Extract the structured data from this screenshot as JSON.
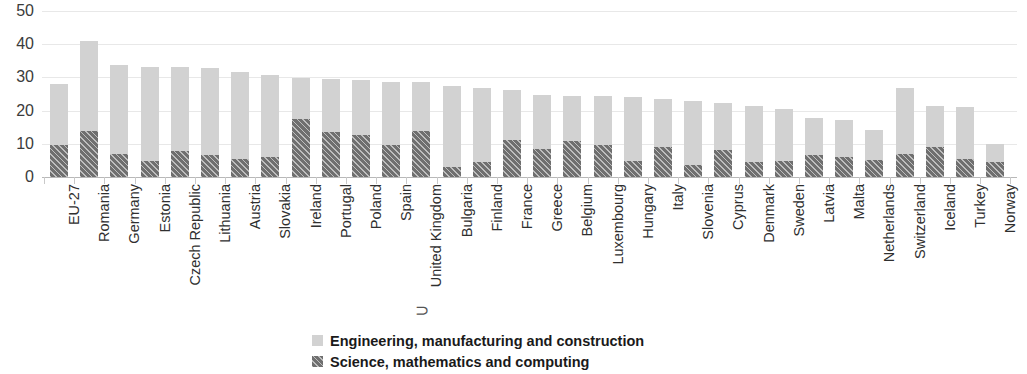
{
  "chart_data": {
    "type": "bar",
    "stacked": true,
    "title": "",
    "xlabel": "",
    "ylabel": "",
    "ylim": [
      0,
      50
    ],
    "yticks": [
      0,
      10,
      20,
      30,
      40,
      50
    ],
    "grid": true,
    "legend_position": "bottom",
    "categories": [
      "EU-27",
      "Romania",
      "Germany",
      "Estonia",
      "Czech Republic",
      "Lithuania",
      "Austria",
      "Slovakia",
      "Ireland",
      "Portugal",
      "Poland",
      "Spain",
      "United Kingdom",
      "Bulgaria",
      "Finland",
      "France",
      "Greece",
      "Belgium",
      "Luxembourg",
      "Hungary",
      "Italy",
      "Slovenia",
      "Cyprus",
      "Denmark",
      "Sweden",
      "Latvia",
      "Malta",
      "Netherlands",
      "Switzerland",
      "Iceland",
      "Turkey",
      "Norway"
    ],
    "series": [
      {
        "name": "Engineering, manufacturing and construction",
        "color": "#d2d2d2",
        "values": [
          18.3,
          27.0,
          26.8,
          28.4,
          25.3,
          26.2,
          26.2,
          24.8,
          12.3,
          15.9,
          16.5,
          19.1,
          14.6,
          24.4,
          22.3,
          15.2,
          16.4,
          13.8,
          14.9,
          19.5,
          14.6,
          19.3,
          14.3,
          16.9,
          15.7,
          11.4,
          11.2,
          9.2,
          19.8,
          12.5,
          15.7,
          5.3
        ]
      },
      {
        "name": "Science, mathematics and computing",
        "color": "#6f6f6f",
        "values": [
          9.7,
          14.0,
          6.9,
          4.8,
          7.7,
          6.7,
          5.5,
          5.9,
          17.5,
          13.5,
          12.6,
          9.6,
          13.9,
          3.1,
          4.6,
          11.0,
          8.3,
          10.7,
          9.6,
          4.7,
          9.0,
          3.6,
          8.0,
          4.5,
          4.9,
          6.5,
          6.0,
          5.1,
          7.0,
          9.0,
          5.3,
          4.5
        ]
      }
    ],
    "totals": [
      28.0,
      41.0,
      33.7,
      33.2,
      33.0,
      32.9,
      31.7,
      30.7,
      29.8,
      29.4,
      29.1,
      28.7,
      28.5,
      27.5,
      26.9,
      26.2,
      24.7,
      24.5,
      24.5,
      24.2,
      23.6,
      22.9,
      22.3,
      21.4,
      20.6,
      17.9,
      17.2,
      14.3,
      26.8,
      21.5,
      21.0,
      9.8
    ]
  },
  "legend": {
    "items": [
      {
        "label": "Engineering, manufacturing and construction",
        "swatch": "light"
      },
      {
        "label": "Science, mathematics and computing",
        "swatch": "dark"
      }
    ]
  },
  "misc": {
    "stray_glyph": "⊃"
  }
}
